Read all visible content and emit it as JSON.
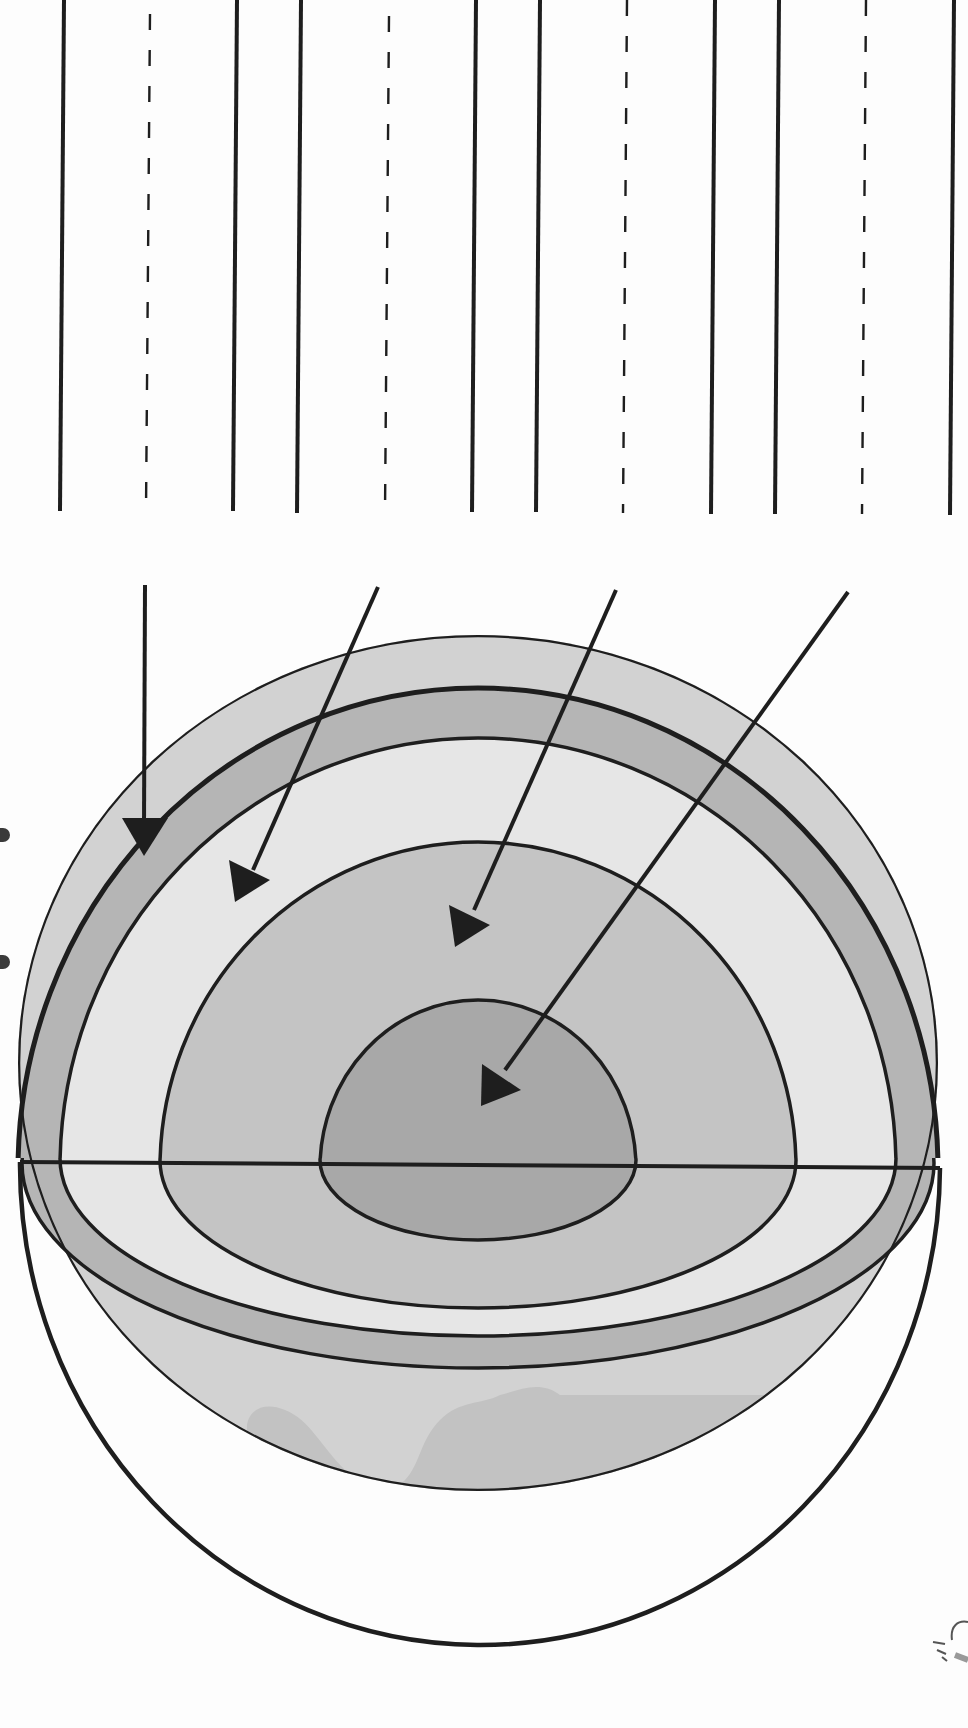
{
  "diagram": {
    "subject": "Layers of the Earth",
    "orientation": "rotated 90deg (page sideways)",
    "colors": {
      "ink": "#1e1e1e",
      "crust": "#b5b5b5",
      "mantle": "#e6e6e6",
      "outer_core": "#c4c4c4",
      "inner_core": "#a8a8a8",
      "surface": "#d2d2d2",
      "continent": "#c2c2c2",
      "paper": "#fdfdfd"
    },
    "writing_lines": {
      "count": 4,
      "description": "handwriting label rows: solid top line, dashed midline, solid baseline",
      "rows": [
        {
          "solid_top_x": 57,
          "dashed_mid_x": 135,
          "solid_base_x": 213
        },
        {
          "solid_top_x": 272,
          "dashed_mid_x": 351,
          "solid_base_x": 431
        },
        {
          "solid_top_x": 490,
          "dashed_mid_x": 568,
          "solid_base_x": 646
        },
        {
          "solid_top_x": 705,
          "dashed_mid_x": 783,
          "solid_base_x": 862
        }
      ]
    },
    "layers": [
      {
        "id": "crust",
        "label_line_index": 0
      },
      {
        "id": "mantle",
        "label_line_index": 1
      },
      {
        "id": "outer-core",
        "label_line_index": 2
      },
      {
        "id": "inner-core",
        "label_line_index": 3
      }
    ],
    "arrows": [
      {
        "target": "crust",
        "from": [
          131,
          532
        ],
        "to": [
          131,
          775
        ]
      },
      {
        "target": "mantle",
        "from": [
          344,
          533
        ],
        "to": [
          215,
          815
        ]
      },
      {
        "target": "outer-core",
        "from": [
          559,
          536
        ],
        "to": [
          413,
          858
        ]
      },
      {
        "target": "inner-core",
        "from": [
          769,
          538
        ],
        "to": [
          439,
          1004
        ]
      }
    ]
  }
}
